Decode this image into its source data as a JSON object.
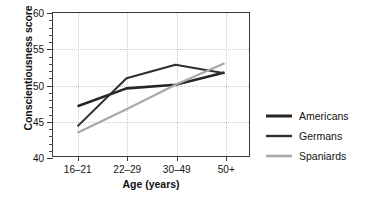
{
  "chart_data": {
    "type": "line",
    "title": "",
    "xlabel": "Age (years)",
    "ylabel": "Conscientiousness score",
    "categories": [
      "16–21",
      "22–29",
      "30–49",
      "50+"
    ],
    "ylim": [
      40,
      60
    ],
    "yticks": [
      40,
      45,
      50,
      55,
      60
    ],
    "ytick_labels": [
      "40",
      "45",
      "50",
      "55",
      "60"
    ],
    "yminor_step": 1,
    "grid": "dotted-both",
    "legend_position": "right",
    "series": [
      {
        "name": "Americans",
        "color": "#262626",
        "width": 2.6,
        "values": [
          47.0,
          49.5,
          50.0,
          51.7
        ]
      },
      {
        "name": "Germans",
        "color": "#2e2e2e",
        "width": 2.0,
        "values": [
          44.2,
          50.9,
          52.8,
          51.6
        ]
      },
      {
        "name": "Spaniards",
        "color": "#a8a8a8",
        "width": 2.2,
        "values": [
          43.3,
          46.6,
          50.0,
          53.0
        ]
      }
    ]
  },
  "legend": {
    "items": [
      {
        "label": "Americans"
      },
      {
        "label": "Germans"
      },
      {
        "label": "Spaniards"
      }
    ]
  }
}
